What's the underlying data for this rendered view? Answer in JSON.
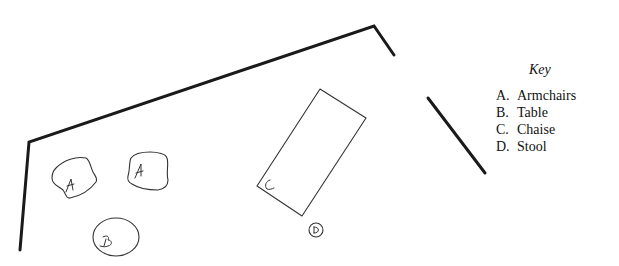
{
  "diagram": {
    "type": "floor-plan-sketch",
    "furniture": [
      {
        "letter": "A",
        "name": "Armchairs",
        "shape": "rounded-square",
        "count": 2
      },
      {
        "letter": "B",
        "name": "Table",
        "shape": "oval"
      },
      {
        "letter": "C",
        "name": "Chaise",
        "shape": "rectangle"
      },
      {
        "letter": "D",
        "name": "Stool",
        "shape": "small-circle"
      }
    ]
  },
  "labels": {
    "armchair_1": "A",
    "armchair_2": "A",
    "table": "B",
    "chaise": "C",
    "stool": "D"
  },
  "key": {
    "title": "Key",
    "items": [
      {
        "letter": "A.",
        "label": "Armchairs"
      },
      {
        "letter": "B.",
        "label": "Table"
      },
      {
        "letter": "C.",
        "label": "Chaise"
      },
      {
        "letter": "D.",
        "label": "Stool"
      }
    ]
  },
  "colors": {
    "wall": "#1a1a1a",
    "furniture": "#333333",
    "background": "#ffffff"
  }
}
